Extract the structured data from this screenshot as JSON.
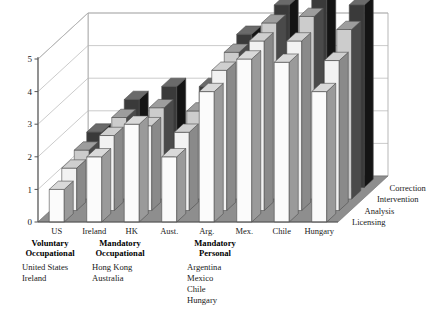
{
  "chart_data": {
    "type": "bar",
    "title": "",
    "xlabel": "",
    "ylabel": "",
    "ylim": [
      0,
      5
    ],
    "yticks": [
      0,
      1,
      2,
      3,
      4,
      5
    ],
    "grid": true,
    "legend_position": "depth-axis-right",
    "projection": "3d",
    "categories": [
      "US",
      "Ireland",
      "HK",
      "Aust.",
      "Arg.",
      "Mex.",
      "Chile",
      "Hungary"
    ],
    "depth_axis": [
      "Licensing",
      "Analysis",
      "Intervention",
      "Correction"
    ],
    "series": [
      {
        "name": "Licensing",
        "values": [
          1.0,
          2.0,
          3.0,
          2.0,
          4.0,
          5.0,
          4.9,
          4.0
        ]
      },
      {
        "name": "Analysis",
        "values": [
          1.3,
          2.3,
          2.6,
          2.4,
          4.3,
          5.2,
          5.2,
          4.6
        ]
      },
      {
        "name": "Intervention",
        "values": [
          1.5,
          2.5,
          2.8,
          2.7,
          4.5,
          5.4,
          5.6,
          5.2
        ]
      },
      {
        "name": "Correction",
        "values": [
          1.7,
          2.7,
          3.1,
          3.1,
          4.7,
          5.6,
          5.8,
          5.6
        ]
      }
    ]
  },
  "ghost_title": "",
  "legend": {
    "groups": [
      {
        "heading_line1": "Voluntary",
        "heading_line2": "Occupational",
        "items": [
          "United States",
          "Ireland"
        ]
      },
      {
        "heading_line1": "Mandatory",
        "heading_line2": "Occupational",
        "items": [
          "Hong Kong",
          "Australia"
        ]
      },
      {
        "heading_line1": "Mandatory",
        "heading_line2": "Personal",
        "items": [
          "Argentina",
          "Mexico",
          "Chile",
          "Hungary"
        ]
      }
    ]
  },
  "colors": {
    "front_face": "#fbfbfb",
    "side_face": "#9a9a9a",
    "top_face": "#d9d9d9",
    "dark_front": "#cccccc",
    "dark_side": "#4a4a4a",
    "black_front": "#3a3a3a",
    "black_side": "#141414",
    "floor": "#8e8e8e",
    "wall": "#ffffff",
    "axis": "#555555",
    "grid": "#b5b5b5"
  }
}
